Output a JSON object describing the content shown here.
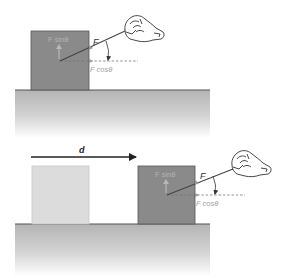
{
  "colors": {
    "box_dark": "#8a8a8a",
    "box_light": "#dcdcdc",
    "ground_top": "#b8b8b8",
    "ground_bottom": "#ffffff",
    "ground_line": "#555555",
    "rope": "#444444",
    "label_dark": "#333333",
    "label_light": "#a8a8a8",
    "label_inbox": "#b4b4b4"
  },
  "top_panel": {
    "force_label": "F",
    "horizontal_component_label": "F cosθ",
    "vertical_component_label": "F sinθ"
  },
  "bottom_panel": {
    "displacement_label": "d",
    "force_label": "F",
    "horizontal_component_label": "F cosθ",
    "vertical_component_label": "F sinθ"
  }
}
